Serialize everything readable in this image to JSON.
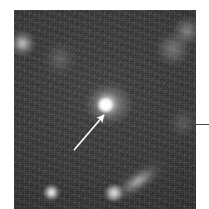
{
  "figure": {
    "kind": "astronomical-image-cutout",
    "modality": "optical-grayscale",
    "caption": "",
    "panel": {
      "x": 14,
      "y": 10,
      "width": 182,
      "height": 199,
      "background_color": "#2c2c2c",
      "border_color": "#ffffff"
    }
  },
  "chart_data": {
    "type": "scatter",
    "title": "",
    "subtitle": "",
    "xlabel": "",
    "ylabel": "",
    "grid": false,
    "legend_position": "none",
    "xlim": [
      0,
      182
    ],
    "ylim": [
      0,
      199
    ],
    "colormap": "grayscale",
    "background_level": "#2e2e2e",
    "categories": [
      "target-source",
      "companion-upper-left",
      "companion-upper-right",
      "companion-upper-right-faint",
      "companion-upper-mid-faint",
      "companion-lower-left",
      "companion-mid-right-faint",
      "extended-streak"
    ],
    "values": [
      100,
      52,
      34,
      28,
      18,
      74,
      16,
      46
    ],
    "points": [
      {
        "name": "target-source",
        "x": 93,
        "y": 95,
        "brightness": 100,
        "size_px": 34,
        "marked": true
      },
      {
        "name": "companion-upper-left",
        "x": 8,
        "y": 33,
        "brightness": 52,
        "size_px": 22,
        "marked": false
      },
      {
        "name": "companion-upper-right",
        "x": 158,
        "y": 38,
        "brightness": 34,
        "size_px": 26,
        "marked": false
      },
      {
        "name": "companion-upper-right-faint",
        "x": 172,
        "y": 22,
        "brightness": 28,
        "size_px": 22,
        "marked": false
      },
      {
        "name": "companion-upper-mid-faint",
        "x": 46,
        "y": 49,
        "brightness": 18,
        "size_px": 20,
        "marked": false
      },
      {
        "name": "companion-lower-left",
        "x": 37,
        "y": 182,
        "brightness": 74,
        "size_px": 20,
        "marked": false
      },
      {
        "name": "companion-mid-right-faint",
        "x": 168,
        "y": 112,
        "brightness": 16,
        "size_px": 20,
        "marked": false
      },
      {
        "name": "extended-streak",
        "x": 120,
        "y": 176,
        "brightness": 46,
        "size_px": 70,
        "marked": false
      }
    ],
    "annotations": [
      {
        "name": "target-arrow",
        "type": "arrow",
        "color": "#ffffff",
        "tail_x": 60,
        "tail_y": 140,
        "tip_x": 90,
        "tip_y": 105,
        "label": ""
      },
      {
        "name": "scale-tick",
        "type": "tick",
        "color": "#4c4c4c",
        "x": 182,
        "y": 114,
        "length_px": 13,
        "label": ""
      }
    ]
  },
  "arrow": {
    "name": "target-indicator-arrow",
    "color": "#ffffff",
    "stroke_width": 1.6,
    "tail": {
      "x": 60,
      "y": 140
    },
    "tip": {
      "x": 90,
      "y": 105
    },
    "head_length": 13,
    "head_width": 9
  },
  "scale_tick": {
    "name": "scale-bar-tick",
    "color": "#4c4c4c",
    "x": 196,
    "y": 124,
    "length_px": 13,
    "thickness_px": 1,
    "label": ""
  }
}
